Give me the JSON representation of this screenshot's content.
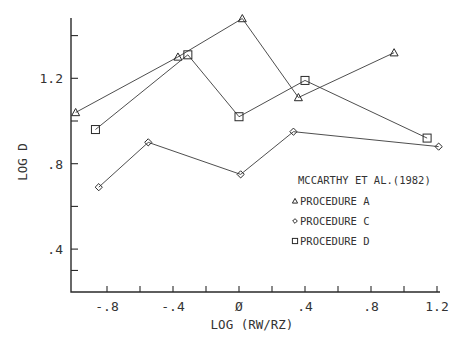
{
  "chart_data": {
    "type": "line",
    "title": "",
    "xlabel": "LOG (RW/RZ)",
    "ylabel": "LOG D",
    "xlim": [
      -1.0,
      1.25
    ],
    "ylim": [
      0.2,
      1.48
    ],
    "x_ticks": [
      -0.8,
      -0.6,
      -0.4,
      -0.2,
      0,
      0.2,
      0.4,
      0.6,
      0.8,
      1.0,
      1.2
    ],
    "x_tick_labels": [
      {
        "value": -0.8,
        "label": "-.8"
      },
      {
        "value": -0.4,
        "label": "-.4"
      },
      {
        "value": 0,
        "label": "Ø"
      },
      {
        "value": 0.4,
        "label": ".4"
      },
      {
        "value": 0.8,
        "label": ".8"
      },
      {
        "value": 1.2,
        "label": "1.2"
      }
    ],
    "y_ticks": [
      0.3,
      0.4,
      0.6,
      0.8,
      1.0,
      1.2,
      1.4
    ],
    "y_tick_labels": [
      {
        "value": 1.2,
        "label": "1.2"
      },
      {
        "value": 0.8,
        "label": ".8"
      },
      {
        "value": 0.4,
        "label": ".4"
      }
    ],
    "grid": false,
    "legend": {
      "title": "MCCARTHY ET AL.(1982)",
      "position": "lower right inside"
    },
    "series": [
      {
        "name": "PROCEDURE A",
        "marker": "triangle",
        "points": [
          [
            -0.99,
            1.04
          ],
          [
            -0.37,
            1.3
          ],
          [
            0.02,
            1.48
          ],
          [
            0.36,
            1.11
          ],
          [
            0.94,
            1.32
          ]
        ]
      },
      {
        "name": "PROCEDURE C",
        "marker": "diamond",
        "points": [
          [
            -0.85,
            0.69
          ],
          [
            -0.55,
            0.9
          ],
          [
            0.01,
            0.75
          ],
          [
            0.33,
            0.95
          ],
          [
            1.21,
            0.88
          ]
        ]
      },
      {
        "name": "PROCEDURE D",
        "marker": "square",
        "points": [
          [
            -0.87,
            0.96
          ],
          [
            -0.31,
            1.31
          ],
          [
            0.0,
            1.02
          ],
          [
            0.4,
            1.19
          ],
          [
            1.14,
            0.92
          ]
        ]
      }
    ]
  },
  "layout": {
    "x0_px": 239,
    "x_px_per_unit": 165,
    "y12_px": 78.3,
    "y_px_per_unit": 213.5,
    "axis_left_px": 71,
    "axis_bottom_px": 292,
    "axis_top_px": 18,
    "axis_right_px": 440
  }
}
